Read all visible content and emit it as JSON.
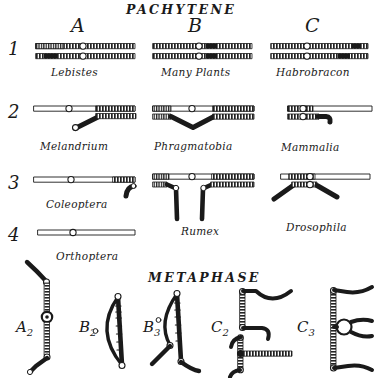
{
  "figure": {
    "sections": [
      {
        "id": "pachytene",
        "title": "PACHYTENE"
      },
      {
        "id": "metaphase",
        "title": "METAPHASE"
      }
    ],
    "columns": [
      {
        "id": "col-a",
        "letter": "A"
      },
      {
        "id": "col-b",
        "letter": "B"
      },
      {
        "id": "col-c",
        "letter": "C"
      }
    ],
    "rows": [
      {
        "id": "row-1",
        "number": "1"
      },
      {
        "id": "row-2",
        "number": "2"
      },
      {
        "id": "row-3",
        "number": "3"
      },
      {
        "id": "row-4",
        "number": "4"
      }
    ],
    "pachytene_cells": [
      {
        "id": "a1",
        "row": "1",
        "column": "A",
        "organism": "Lebistes"
      },
      {
        "id": "b1",
        "row": "1",
        "column": "B",
        "organism": "Many Plants"
      },
      {
        "id": "c1",
        "row": "1",
        "column": "C",
        "organism": "Habrobracon"
      },
      {
        "id": "a2",
        "row": "2",
        "column": "A",
        "organism": "Melandrium"
      },
      {
        "id": "b2",
        "row": "2",
        "column": "B",
        "organism": "Phragmatobia"
      },
      {
        "id": "c2",
        "row": "2",
        "column": "C",
        "organism": "Mammalia"
      },
      {
        "id": "a3",
        "row": "3",
        "column": "A",
        "organism": "Coleoptera"
      },
      {
        "id": "b3",
        "row": "3",
        "column": "B",
        "organism": "Rumex"
      },
      {
        "id": "c3",
        "row": "3",
        "column": "C",
        "organism": "Drosophila"
      },
      {
        "id": "a4",
        "row": "4",
        "column": "A",
        "organism": "Orthoptera"
      }
    ],
    "metaphase_figures": [
      {
        "id": "m-a2",
        "base": "A",
        "sub": "2"
      },
      {
        "id": "m-b2",
        "base": "B",
        "sub": "2"
      },
      {
        "id": "m-b3",
        "base": "B",
        "sub": "3"
      },
      {
        "id": "m-c2",
        "base": "C",
        "sub": "2"
      },
      {
        "id": "m-c3",
        "base": "C",
        "sub": "3"
      }
    ],
    "colors": {
      "ink": "#1a1a1a",
      "paper": "#ffffff",
      "centromere_fill": "#ffffff"
    }
  }
}
